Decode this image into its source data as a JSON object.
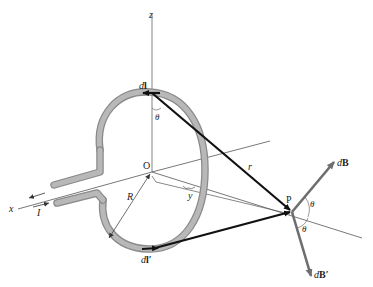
{
  "diagram": {
    "labels": {
      "z_axis": "z",
      "x_axis": "x",
      "origin": "O",
      "radius": "R",
      "distance_y": "y",
      "distance_r": "r",
      "point": "P",
      "current": "I",
      "dl_top_d": "d",
      "dl_top_l": "l",
      "dl_bottom_d": "d",
      "dl_bottom_l": "l′",
      "theta_top": "θ",
      "theta_p_upper": "θ",
      "theta_p_lower": "θ",
      "dB_d": "d",
      "dB_B": "B",
      "dBprime_d": "d",
      "dBprime_B": "B′"
    },
    "colors": {
      "wire": "#a8a8a8",
      "wire_edge": "#8a8a8a",
      "vector": "#111111",
      "field_vector": "#6e6e6e",
      "axis": "#555555"
    }
  }
}
